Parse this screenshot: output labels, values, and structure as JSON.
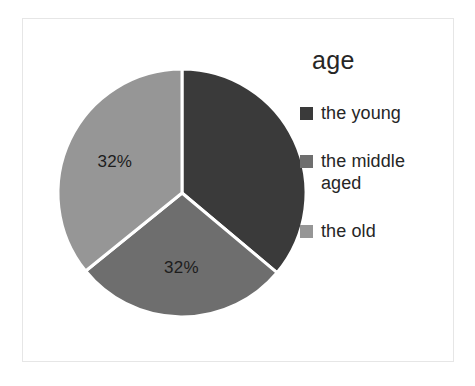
{
  "chart_data": {
    "type": "pie",
    "title": "",
    "legend_title": "age",
    "legend_position": "right",
    "categories": [
      "the young",
      "the middle aged",
      "the old"
    ],
    "values": [
      36,
      32,
      32
    ],
    "value_unit": "percent",
    "data_labels": [
      "",
      "32%",
      "32%"
    ],
    "data_labels_note": "The first slice's data label is rendered dark-on-dark and is not legible in the source image.",
    "start_angle_deg": 0,
    "direction": "clockwise",
    "slice_angles_deg": [
      130,
      101,
      129
    ],
    "colors": [
      "#3a3a3a",
      "#6e6e6e",
      "#969696"
    ],
    "separator_color": "#ffffff",
    "background": "#ffffff",
    "grid": false
  },
  "legend": {
    "title": "age",
    "items": [
      {
        "label": "the young",
        "color": "#3a3a3a",
        "swatch_name": "legend-swatch-the-young"
      },
      {
        "label": "the middle aged",
        "color": "#6e6e6e",
        "swatch_name": "legend-swatch-the-middle-aged"
      },
      {
        "label": "the old",
        "color": "#969696",
        "swatch_name": "legend-swatch-the-old"
      }
    ]
  },
  "pie": {
    "center": {
      "x": 130,
      "y": 130
    },
    "radius": 124,
    "slices": [
      {
        "name": "the young",
        "color": "#3a3a3a",
        "start_deg": 0,
        "end_deg": 130,
        "label": "",
        "label_x": 182,
        "label_y": 110
      },
      {
        "name": "the middle aged",
        "color": "#6e6e6e",
        "start_deg": 130,
        "end_deg": 231,
        "label": "32%",
        "label_x": 118,
        "label_y": 172
      },
      {
        "name": "the old",
        "color": "#969696",
        "start_deg": 231,
        "end_deg": 360,
        "label": "32%",
        "label_x": 70,
        "label_y": 82
      }
    ]
  },
  "frame": {
    "border_color": "#e6e6e6"
  }
}
